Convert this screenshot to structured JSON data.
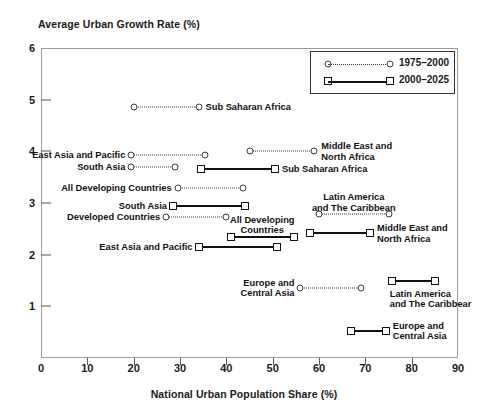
{
  "chart_data": {
    "type": "scatter",
    "title": "",
    "ylabel": "Average Urban Growth Rate (%)",
    "xlabel": "National Urban Population Share (%)",
    "xlim": [
      0,
      90
    ],
    "ylim": [
      0,
      6
    ],
    "xticks": [
      0,
      10,
      20,
      30,
      40,
      50,
      60,
      70,
      80,
      90
    ],
    "yticks": [
      1,
      2,
      3,
      4,
      5,
      6
    ],
    "grid": false,
    "legend_position": "top-right",
    "legend": [
      {
        "name": "1975–2000",
        "marker": "circle",
        "line": "dotted"
      },
      {
        "name": "2000–2025",
        "marker": "square",
        "line": "solid"
      }
    ],
    "series": [
      {
        "name": "1975–2000",
        "marker": "circle",
        "line": "dotted",
        "segments": [
          {
            "label": "Sub Saharan Africa",
            "x_start": 20.0,
            "x_end": 34.0,
            "y": 4.85,
            "label_side": "right"
          },
          {
            "label": "East Asia and Pacific",
            "x_start": 19.5,
            "x_end": 35.5,
            "y": 3.93,
            "label_side": "left"
          },
          {
            "label": "South Asia",
            "x_start": 19.5,
            "x_end": 29.0,
            "y": 3.7,
            "label_side": "left"
          },
          {
            "label": "All Developing Countries",
            "x_start": 29.5,
            "x_end": 43.5,
            "y": 3.3,
            "label_side": "left"
          },
          {
            "label": "Developed Countries",
            "x_start": 27.0,
            "x_end": 40.0,
            "y": 2.72,
            "label_side": "left"
          },
          {
            "label": "Middle East and\nNorth Africa",
            "x_start": 45.0,
            "x_end": 59.0,
            "y": 4.0,
            "label_side": "right"
          },
          {
            "label": "Latin America\nand The Caribbean",
            "x_start": 60.0,
            "x_end": 75.0,
            "y": 2.78,
            "label_side": "above"
          },
          {
            "label": "Europe and\nCentral Asia",
            "x_start": 56.0,
            "x_end": 69.0,
            "y": 1.36,
            "label_side": "left"
          }
        ]
      },
      {
        "name": "2000–2025",
        "marker": "square",
        "line": "solid",
        "segments": [
          {
            "label": "Sub Saharan Africa",
            "x_start": 34.5,
            "x_end": 50.5,
            "y": 3.66,
            "label_side": "right"
          },
          {
            "label": "South Asia",
            "x_start": 28.5,
            "x_end": 44.0,
            "y": 2.94,
            "label_side": "left"
          },
          {
            "label": "All Developing\nCountries",
            "x_start": 41.0,
            "x_end": 54.5,
            "y": 2.35,
            "label_side": "above"
          },
          {
            "label": "East Asia and Pacific",
            "x_start": 34.0,
            "x_end": 51.0,
            "y": 2.14,
            "label_side": "left"
          },
          {
            "label": "Middle East and\nNorth Africa",
            "x_start": 58.0,
            "x_end": 71.0,
            "y": 2.41,
            "label_side": "right"
          },
          {
            "label": "Latin America\nand The Caribbear",
            "x_start": 75.7,
            "x_end": 85.0,
            "y": 1.5,
            "label_side": "below-right"
          },
          {
            "label": "Europe and\nCentral Asia",
            "x_start": 67.0,
            "x_end": 74.4,
            "y": 0.53,
            "label_side": "right"
          }
        ]
      }
    ]
  }
}
